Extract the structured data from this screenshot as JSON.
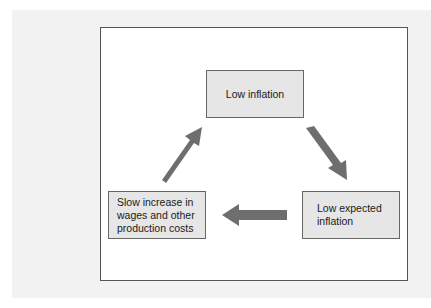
{
  "diagram": {
    "type": "cycle",
    "nodes": [
      {
        "id": "low-inflation",
        "label": "Low inflation"
      },
      {
        "id": "low-expected-inflation",
        "label": "Low expected\ninflation"
      },
      {
        "id": "slow-increase",
        "label": "Slow increase in\nwages and other\nproduction costs"
      }
    ],
    "edges": [
      {
        "from": "low-inflation",
        "to": "low-expected-inflation"
      },
      {
        "from": "low-expected-inflation",
        "to": "slow-increase"
      },
      {
        "from": "slow-increase",
        "to": "low-inflation"
      }
    ],
    "colors": {
      "node_fill": "#e6e6e6",
      "arrow": "#6e6e6e",
      "frame_border": "#555555"
    }
  }
}
